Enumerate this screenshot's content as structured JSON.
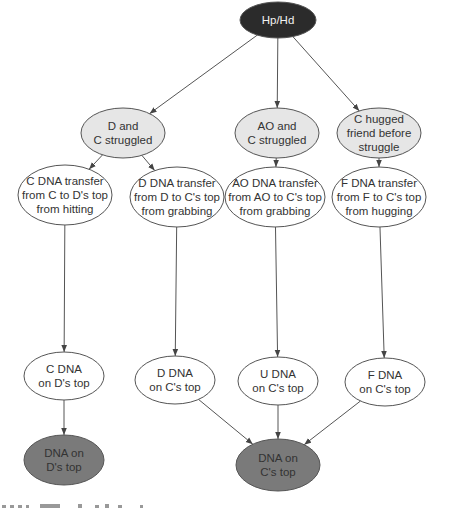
{
  "diagram": {
    "type": "bayesian-network",
    "colors": {
      "root_fill": "#2b2b2b",
      "activity_fill": "#e6e6e6",
      "transfer_fill": "#ffffff",
      "result_fill": "#7a7a7a",
      "edge": "#555555"
    },
    "nodes": [
      {
        "id": "hp_hd",
        "label": "Hp/Hd",
        "lines": [
          "Hp/Hd"
        ],
        "kind": "root",
        "cx": 278,
        "cy": 20,
        "rx": 38,
        "ry": 18
      },
      {
        "id": "d_c_struggled",
        "lines": [
          "D and",
          "C struggled"
        ],
        "kind": "activity",
        "cx": 123,
        "cy": 133,
        "rx": 42,
        "ry": 25
      },
      {
        "id": "ao_c_struggled",
        "lines": [
          "AO and",
          "C struggled"
        ],
        "kind": "activity",
        "cx": 277,
        "cy": 133,
        "rx": 42,
        "ry": 25
      },
      {
        "id": "c_hugged",
        "lines": [
          "C hugged",
          "friend before",
          "struggle"
        ],
        "kind": "activity",
        "cx": 379,
        "cy": 133,
        "rx": 42,
        "ry": 25
      },
      {
        "id": "c_dna_transfer",
        "lines": [
          "C DNA transfer",
          "from C to D's top",
          "from hitting"
        ],
        "kind": "transfer",
        "cx": 65,
        "cy": 195,
        "rx": 47,
        "ry": 30
      },
      {
        "id": "d_dna_transfer",
        "lines": [
          "D DNA transfer",
          "from D to C's top",
          "from grabbing"
        ],
        "kind": "transfer",
        "cx": 177,
        "cy": 197,
        "rx": 47,
        "ry": 30
      },
      {
        "id": "ao_dna_transfer",
        "lines": [
          "AO DNA transfer",
          "from AO to C's top",
          "from grabbing"
        ],
        "kind": "transfer",
        "cx": 275,
        "cy": 197,
        "rx": 50,
        "ry": 30
      },
      {
        "id": "f_dna_transfer",
        "lines": [
          "F DNA transfer",
          "from F to C's top",
          "from hugging"
        ],
        "kind": "transfer",
        "cx": 379,
        "cy": 197,
        "rx": 47,
        "ry": 30
      },
      {
        "id": "c_dna_on_d",
        "lines": [
          "C DNA",
          "on D's top"
        ],
        "kind": "transfer",
        "cx": 64,
        "cy": 376,
        "rx": 40,
        "ry": 24
      },
      {
        "id": "d_dna_on_c",
        "lines": [
          "D DNA",
          "on C's top"
        ],
        "kind": "transfer",
        "cx": 175,
        "cy": 380,
        "rx": 40,
        "ry": 24
      },
      {
        "id": "u_dna_on_c",
        "lines": [
          "U DNA",
          "on C's top"
        ],
        "kind": "transfer",
        "cx": 278,
        "cy": 381,
        "rx": 40,
        "ry": 24
      },
      {
        "id": "f_dna_on_c",
        "lines": [
          "F DNA",
          "on C's top"
        ],
        "kind": "transfer",
        "cx": 385,
        "cy": 382,
        "rx": 40,
        "ry": 24
      },
      {
        "id": "dna_on_d",
        "lines": [
          "DNA on",
          "D's top"
        ],
        "kind": "result",
        "cx": 64,
        "cy": 460,
        "rx": 40,
        "ry": 25
      },
      {
        "id": "dna_on_c",
        "lines": [
          "DNA on",
          "C's top"
        ],
        "kind": "result",
        "cx": 278,
        "cy": 465,
        "rx": 42,
        "ry": 26
      }
    ],
    "edges": [
      [
        "hp_hd",
        "d_c_struggled"
      ],
      [
        "hp_hd",
        "ao_c_struggled"
      ],
      [
        "hp_hd",
        "c_hugged"
      ],
      [
        "d_c_struggled",
        "c_dna_transfer"
      ],
      [
        "d_c_struggled",
        "d_dna_transfer"
      ],
      [
        "ao_c_struggled",
        "ao_dna_transfer"
      ],
      [
        "c_hugged",
        "f_dna_transfer"
      ],
      [
        "c_dna_transfer",
        "c_dna_on_d"
      ],
      [
        "d_dna_transfer",
        "d_dna_on_c"
      ],
      [
        "ao_dna_transfer",
        "u_dna_on_c"
      ],
      [
        "f_dna_transfer",
        "f_dna_on_c"
      ],
      [
        "c_dna_on_d",
        "dna_on_d"
      ],
      [
        "d_dna_on_c",
        "dna_on_c"
      ],
      [
        "u_dna_on_c",
        "dna_on_c"
      ],
      [
        "f_dna_on_c",
        "dna_on_c"
      ]
    ]
  }
}
